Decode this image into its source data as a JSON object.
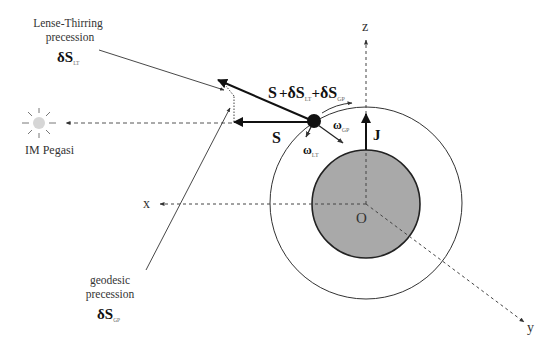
{
  "diagram": {
    "type": "physics-schematic",
    "axes": {
      "x_label": "x",
      "y_label": "y",
      "z_label": "z",
      "origin_label": "O"
    },
    "vectors": {
      "spin_label": "S",
      "angular_momentum_label": "J",
      "sum_main": "S",
      "sum_plus1": "+",
      "sum_delta1": "δS",
      "sum_sub1": "LT",
      "sum_plus2": "+",
      "sum_delta2": "δS",
      "sum_sub2": "GP",
      "omega_gp": "ω",
      "omega_gp_sub": "GP",
      "omega_lt": "ω",
      "omega_lt_sub": "LT"
    },
    "annotations": {
      "lense_thirring": {
        "line1": "Lense-Thirring",
        "line2": "precession",
        "symbol": "δS",
        "sub": "LT"
      },
      "geodesic": {
        "line1": "geodesic",
        "line2": "precession",
        "symbol": "δS",
        "sub": "GP"
      },
      "guide_star": "IM Pegasi"
    },
    "colors": {
      "earth_fill": "#a9a9a9",
      "line": "#222222",
      "star": "#d6d6d6"
    }
  }
}
